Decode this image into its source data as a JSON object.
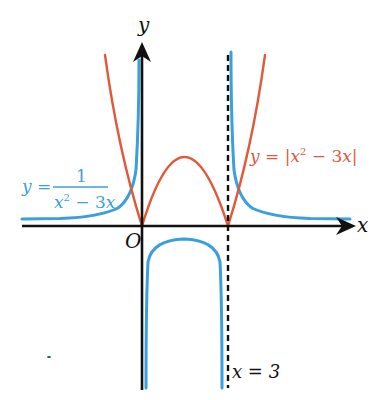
{
  "diagram": {
    "axes": {
      "x_label": "x",
      "y_label": "y",
      "origin_label": "O"
    },
    "asymptote": {
      "label": "x = 3",
      "x_value": 3,
      "style": "dashed"
    },
    "curves": [
      {
        "name": "abs-quadratic",
        "label_prefix": "y = ",
        "label_bar_open": "|",
        "label_x": "x",
        "label_exp": "2",
        "label_rest": " − 3",
        "label_x2": "x",
        "label_bar_close": "|",
        "color": "#e0593a",
        "roots": [
          0,
          3
        ],
        "local_max": {
          "x": 1.5,
          "y": 2.25
        }
      },
      {
        "name": "reciprocal",
        "label_prefix": "y =",
        "label_numerator": "1",
        "label_den_x": "x",
        "label_den_exp": "2",
        "label_den_rest": " − 3",
        "label_den_x2": "x",
        "color": "#3aa0dc",
        "vertical_asymptotes": [
          0,
          3
        ],
        "horizontal_asymptote": 0,
        "local_max": {
          "x": 1.5,
          "y": -0.444
        }
      }
    ],
    "colors": {
      "axis": "#111111",
      "red_curve": "#e0593a",
      "blue_curve": "#3aa0dc"
    }
  }
}
